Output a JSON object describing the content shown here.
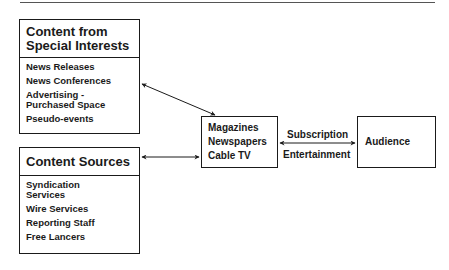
{
  "diagram": {
    "special_interests": {
      "title_line1": "Content from",
      "title_line2": "Special Interests",
      "items": [
        {
          "line1": "News Releases"
        },
        {
          "line1": "News Conferences"
        },
        {
          "line1": "Advertising -",
          "line2": "Purchased Space"
        },
        {
          "line1": "Pseudo-events"
        }
      ]
    },
    "content_sources": {
      "title": "Content Sources",
      "items": [
        {
          "line1": "Syndication",
          "line2": "Services"
        },
        {
          "line1": "Wire Services"
        },
        {
          "line1": "Reporting Staff"
        },
        {
          "line1": "Free Lancers"
        }
      ]
    },
    "media": {
      "items": [
        "Magazines",
        "Newspapers",
        "Cable TV"
      ]
    },
    "audience": {
      "label": "Audience"
    },
    "connector_labels": {
      "top": "Subscription",
      "bottom": "Entertainment"
    },
    "line_color": "#1a1a1a"
  }
}
